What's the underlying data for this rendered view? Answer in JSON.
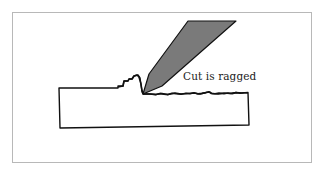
{
  "diagram": {
    "annotation": "Cut is ragged",
    "elements": {
      "tool": "cutting-tool",
      "workpiece": "workpiece-block",
      "chip": "curled-chip",
      "cut_surface": "ragged-cut-surface"
    },
    "colors": {
      "tool_fill": "#7a7a7a",
      "outline": "#111111",
      "frame": "#b8b8b8",
      "background": "#ffffff"
    }
  }
}
